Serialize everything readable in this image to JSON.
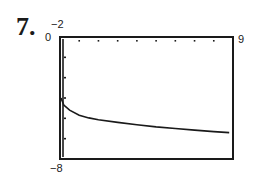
{
  "problem": {
    "number": "7."
  },
  "window_labels": {
    "ymax": "−2",
    "xmin": "0",
    "xmax": "9",
    "ymin": "−8"
  },
  "chart_data": {
    "type": "line",
    "title": "",
    "xlabel": "",
    "ylabel": "",
    "xlim": [
      0,
      9
    ],
    "ylim": [
      -8,
      -2
    ],
    "x_ticks": [
      1,
      2,
      3,
      4,
      5,
      6,
      7,
      8
    ],
    "y_ticks": [
      -3,
      -4,
      -5,
      -6,
      -7
    ],
    "grid": false,
    "legend": null,
    "series": [
      {
        "name": "curve",
        "x": [
          0.05,
          0.2,
          0.5,
          1.0,
          1.5,
          2.0,
          3.0,
          4.0,
          5.0,
          6.0,
          7.0,
          8.0,
          8.8
        ],
        "y": [
          -5.0,
          -5.35,
          -5.6,
          -5.85,
          -5.98,
          -6.07,
          -6.2,
          -6.32,
          -6.42,
          -6.5,
          -6.58,
          -6.65,
          -6.7
        ]
      }
    ]
  },
  "colors": {
    "frame": "#1a1a1a",
    "curve": "#1a1a1a",
    "background": "#ffffff"
  }
}
